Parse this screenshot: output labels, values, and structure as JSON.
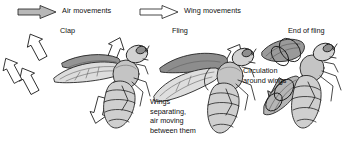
{
  "figure": {
    "title_visible": false,
    "background_color": "#ffffff",
    "line_color": "#1a1a1a"
  },
  "legend": {
    "items": [
      {
        "id": "air-movements",
        "label": "Air movements",
        "arrow_style": "filled-gray",
        "fill_color": "#b8b8b8",
        "stroke_color": "#1a1a1a",
        "x": 18,
        "y": 5
      },
      {
        "id": "wing-movements",
        "label": "Wing movements",
        "arrow_style": "outline-white",
        "fill_color": "#ffffff",
        "stroke_color": "#1a1a1a",
        "x": 140,
        "y": 5
      }
    ]
  },
  "stages": [
    {
      "id": "clap",
      "label": "Clap",
      "x": 60,
      "y": 26
    },
    {
      "id": "fling",
      "label": "Fling",
      "x": 172,
      "y": 26
    },
    {
      "id": "end-of-fling",
      "label": "End of fling",
      "x": 288,
      "y": 26
    }
  ],
  "annotations": [
    {
      "id": "wings-separating",
      "lines": [
        "Wings",
        "separating,",
        "air moving",
        "between them"
      ],
      "text": "Wings separating, air moving between them",
      "x": 150,
      "y": 97
    },
    {
      "id": "circulation-around-wings",
      "lines": [
        "Circulation",
        "around wings"
      ],
      "text": "Circulation around wings",
      "x": 243,
      "y": 66
    }
  ],
  "arrows": [
    {
      "id": "clap-air-upper-left",
      "group": "clap",
      "kind": "air",
      "direction": "up-left",
      "x": 14,
      "y": 38
    },
    {
      "id": "clap-air-lower-left",
      "group": "clap",
      "kind": "air",
      "direction": "up-left",
      "x": 10,
      "y": 68
    },
    {
      "id": "clap-air-edge",
      "group": "clap",
      "kind": "air",
      "direction": "up-left",
      "x": -6,
      "y": 58
    },
    {
      "id": "fling-wing-up",
      "group": "fling",
      "kind": "wing",
      "direction": "up",
      "x": 138,
      "y": 36
    },
    {
      "id": "fling-wing-down",
      "group": "fling",
      "kind": "wing",
      "direction": "down",
      "x": 134,
      "y": 90
    },
    {
      "id": "endfling-wing-up",
      "group": "end-of-fling",
      "kind": "wing",
      "direction": "up-right",
      "x": 248,
      "y": 40
    },
    {
      "id": "endfling-air-down",
      "group": "end-of-fling",
      "kind": "air",
      "direction": "down-right",
      "x": 264,
      "y": 112
    }
  ],
  "bees": [
    {
      "id": "bee-clap",
      "stage": "clap",
      "wing_position": "wings together above body",
      "x": 18,
      "y": 36
    },
    {
      "id": "bee-fling",
      "stage": "fling",
      "wing_position": "wings separating",
      "x": 150,
      "y": 38
    },
    {
      "id": "bee-end-of-fling",
      "stage": "end-of-fling",
      "wing_position": "wings fully apart",
      "x": 258,
      "y": 34
    }
  ],
  "colors": {
    "wing_light": "#d9d9d9",
    "wing_dark": "#8a8a8a",
    "body_fill": "#c9c9c9",
    "body_light": "#e3e3e3",
    "outline": "#1a1a1a",
    "arrow_air_fill": "#b3b3b3",
    "arrow_wing_fill": "#ffffff"
  }
}
